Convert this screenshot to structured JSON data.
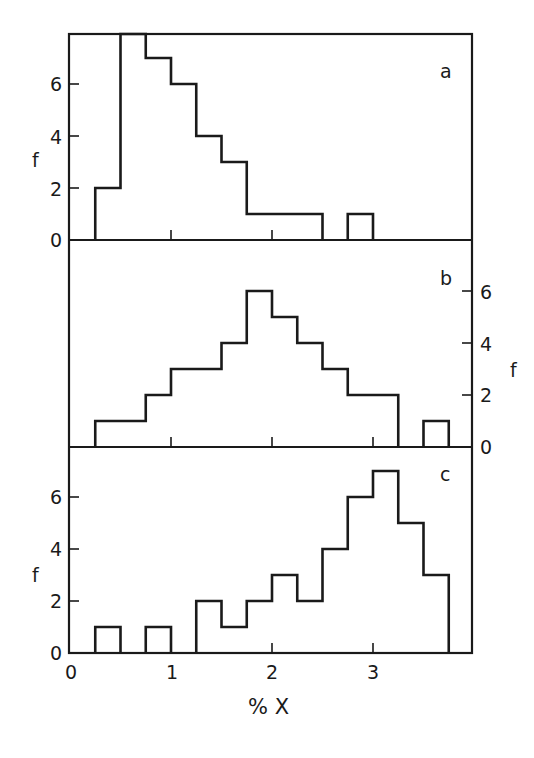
{
  "chart_data": [
    {
      "panel": "a",
      "type": "bar",
      "histogram": true,
      "bin_width": 0.25,
      "bin_edges": [
        0.25,
        0.5,
        0.75,
        1.0,
        1.25,
        1.5,
        1.75,
        2.0,
        2.25,
        2.5,
        2.75,
        3.0
      ],
      "values": [
        2,
        8,
        7,
        6,
        4,
        3,
        1,
        1,
        1,
        0,
        1
      ],
      "note": "bin 0.5-0.75 exceeds plot top (clipped)",
      "ylabel": "f",
      "yticks": [
        0,
        2,
        4,
        6
      ],
      "ylim": [
        0,
        7.9
      ],
      "yaxis_side": "left",
      "xlim": [
        0,
        4
      ]
    },
    {
      "panel": "b",
      "type": "bar",
      "histogram": true,
      "bin_width": 0.25,
      "bin_edges": [
        0.25,
        0.5,
        0.75,
        1.0,
        1.25,
        1.5,
        1.75,
        2.0,
        2.25,
        2.5,
        2.75,
        3.0,
        3.25,
        3.5,
        3.75
      ],
      "values": [
        1,
        1,
        2,
        3,
        3,
        4,
        6,
        5,
        4,
        3,
        2,
        2,
        0,
        1
      ],
      "ylabel": "f",
      "yticks": [
        0,
        2,
        4,
        6
      ],
      "ylim": [
        0,
        7.9
      ],
      "yaxis_side": "right",
      "xlim": [
        0,
        4
      ]
    },
    {
      "panel": "c",
      "type": "bar",
      "histogram": true,
      "bin_width": 0.25,
      "bin_edges": [
        0.25,
        0.5,
        0.75,
        1.0,
        1.25,
        1.5,
        1.75,
        2.0,
        2.25,
        2.5,
        2.75,
        3.0,
        3.25,
        3.5,
        3.75
      ],
      "values": [
        1,
        0,
        1,
        0,
        2,
        1,
        2,
        3,
        2,
        4,
        6,
        7,
        5,
        3
      ],
      "ylabel": "f",
      "yticks": [
        0,
        2,
        4,
        6
      ],
      "ylim": [
        0,
        7.9
      ],
      "yaxis_side": "left",
      "xlabel": "% X",
      "xticks": [
        0,
        1,
        2,
        3
      ],
      "xlim": [
        0,
        4
      ]
    }
  ],
  "labels": {
    "panel_a": "a",
    "panel_b": "b",
    "panel_c": "c",
    "ylabel": "f",
    "xlabel": "% X",
    "yticks": [
      "0",
      "2",
      "4",
      "6"
    ],
    "xticks": [
      "0",
      "1",
      "2",
      "3"
    ]
  }
}
